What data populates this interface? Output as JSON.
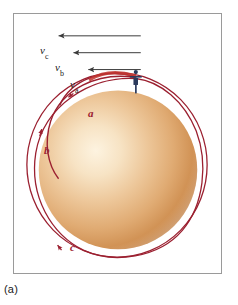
{
  "figure": {
    "caption": "(a)",
    "frame_color": "#9a9a9a",
    "background": "#ffffff"
  },
  "planet": {
    "name": "planet-sphere",
    "highlight_color": "#fdf0d8",
    "mid_color": "#e2b07a",
    "edge_color": "#b5753c",
    "center_x": 118,
    "center_y": 170,
    "radius": 80
  },
  "thrower": {
    "name": "person-throwing",
    "body_color": "#2b3a5c",
    "skin_color": "#e8c49a",
    "x": 136,
    "y": 84
  },
  "velocities": [
    {
      "id": "vc",
      "symbol": "v",
      "subscript": "c",
      "label": "vc",
      "arrow_color": "#3a3a3a",
      "arrow_tail_x": 141,
      "arrow_head_x": 56,
      "arrow_y": 35
    },
    {
      "id": "vb",
      "symbol": "v",
      "subscript": "b",
      "label": "vb",
      "arrow_color": "#3a3a3a",
      "arrow_tail_x": 141,
      "arrow_head_x": 71,
      "arrow_y": 52
    },
    {
      "id": "va",
      "symbol": "v",
      "subscript": "a",
      "label": "va",
      "arrow_color": "#3a3a3a",
      "arrow_tail_x": 141,
      "arrow_head_x": 86,
      "arrow_y": 69
    }
  ],
  "trajectories": [
    {
      "id": "a",
      "label": "a",
      "color": "#9b2030",
      "description": "smallest ellipse, falls back toward planet"
    },
    {
      "id": "b",
      "label": "b",
      "color": "#9b2030",
      "description": "intermediate ellipse"
    },
    {
      "id": "c",
      "label": "c",
      "color": "#9b2030",
      "description": "largest orbit, circles the planet"
    }
  ],
  "colors": {
    "trajectory_red": "#9b2030",
    "arrow_gray": "#3a3a3a",
    "frame_gray": "#9a9a9a",
    "text_black": "#1a1a1a"
  }
}
